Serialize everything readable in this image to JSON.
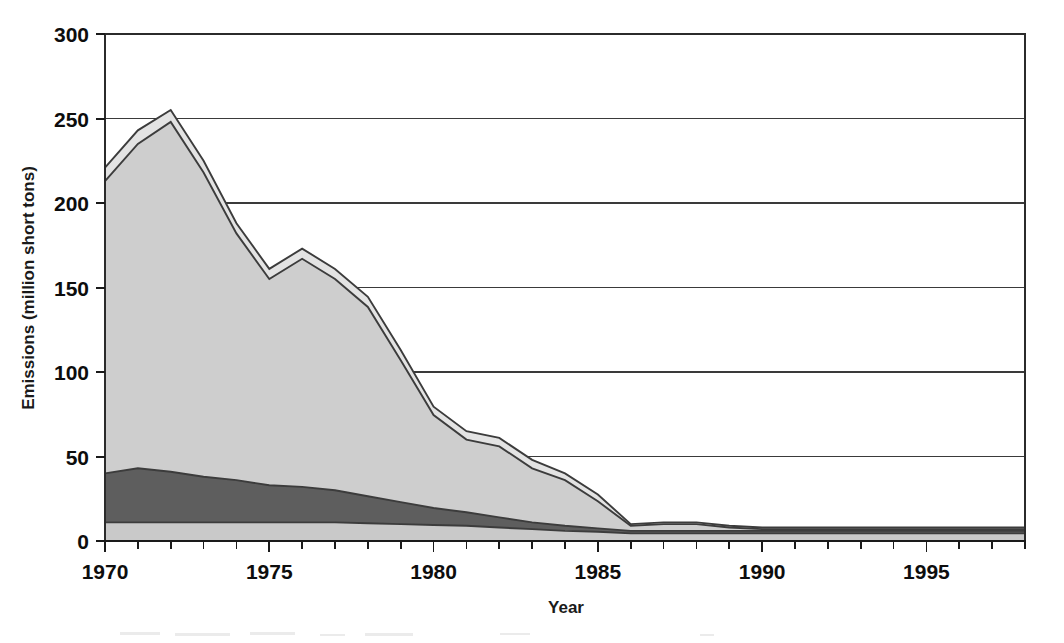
{
  "chart_data": {
    "type": "area",
    "stacked": true,
    "title": "",
    "subtitle": "",
    "xlabel": "Year",
    "ylabel": "Emissions (million short tons)",
    "xlim": [
      1970,
      1998
    ],
    "ylim": [
      0,
      300
    ],
    "yticks": [
      0,
      50,
      100,
      150,
      200,
      250,
      300
    ],
    "ytick_labels": [
      "0",
      "50",
      "100",
      "150",
      "200",
      "250",
      "300"
    ],
    "xticks": [
      1970,
      1975,
      1980,
      1985,
      1990,
      1995
    ],
    "xtick_labels": [
      "1970",
      "1975",
      "1980",
      "1985",
      "1990",
      "1995"
    ],
    "minor_xticks_every": 1,
    "grid": "horizontal",
    "legend": "none",
    "x": [
      1970,
      1971,
      1972,
      1973,
      1974,
      1975,
      1976,
      1977,
      1978,
      1979,
      1980,
      1981,
      1982,
      1983,
      1984,
      1985,
      1986,
      1987,
      1988,
      1989,
      1990,
      1991,
      1992,
      1993,
      1994,
      1995,
      1996,
      1997,
      1998
    ],
    "series": [
      {
        "name": "bottom-band",
        "color": "#c9c9c9",
        "values": [
          11,
          11,
          11,
          11,
          11,
          11,
          11,
          11,
          10.5,
          10,
          9.5,
          9,
          8,
          7,
          6,
          5.5,
          4.5,
          4.5,
          4.5,
          4.5,
          4.5,
          4.5,
          4.5,
          4.5,
          4.5,
          4.5,
          4.5,
          4.5,
          4.5
        ]
      },
      {
        "name": "middle-band",
        "color": "#5e5e5e",
        "values": [
          29,
          32,
          30,
          27,
          25,
          22,
          21,
          19,
          16,
          13,
          10,
          8,
          6,
          4,
          3,
          2,
          1.5,
          1.5,
          1.5,
          1.5,
          1.5,
          1.5,
          1.5,
          1.5,
          1.5,
          1.5,
          1.5,
          1.5,
          1.5
        ]
      },
      {
        "name": "upper-band",
        "color": "#cecece",
        "values": [
          173,
          192,
          207,
          180,
          146,
          122,
          135,
          125,
          112,
          84,
          55,
          43,
          42,
          32,
          27,
          16,
          3,
          4,
          4,
          2,
          1,
          1,
          1,
          1,
          1,
          1,
          1,
          1,
          1
        ]
      },
      {
        "name": "top-band",
        "color": "#e3e3e3",
        "values": [
          8,
          8,
          7,
          7,
          6,
          6,
          6,
          6,
          6,
          6,
          5,
          5,
          5,
          5,
          4,
          4,
          1,
          1,
          1,
          1,
          1,
          1,
          1,
          1,
          1,
          1,
          1,
          1,
          1
        ]
      }
    ],
    "totals": [
      221,
      243,
      255,
      225,
      188,
      161,
      173,
      156,
      144.5,
      113,
      79.5,
      65,
      61,
      48,
      40,
      27.5,
      10,
      11,
      11,
      9,
      8,
      8,
      8,
      8,
      8,
      8,
      8,
      8,
      8
    ],
    "notes": {
      "peak_total_year": 1972,
      "peak_total_value": 255,
      "start_total_value": 221,
      "end_total_value": 8
    }
  },
  "axis": {
    "ylabel_text": "Emissions (million short tons)",
    "xlabel_text": "Year"
  },
  "colors": {
    "bottom_band": "#c9c9c9",
    "middle_band": "#5e5e5e",
    "upper_band": "#cecece",
    "top_band": "#e3e3e3",
    "outline": "#3c3c3c",
    "axis": "#1a1a1a",
    "grid": "#3a3a3a",
    "background": "#ffffff"
  }
}
